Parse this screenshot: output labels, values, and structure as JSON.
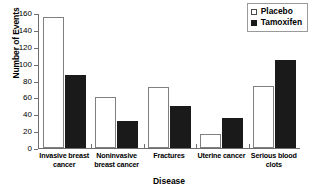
{
  "chart_data": {
    "type": "bar",
    "title": "",
    "subtitle": "",
    "xlabel": "Disease",
    "ylabel": "Number of Events",
    "ylim": [
      0,
      160
    ],
    "yticks": [
      0,
      20,
      40,
      60,
      80,
      100,
      120,
      140,
      160
    ],
    "grid": false,
    "legend_position": "top-right",
    "categories": [
      "Invasive breast cancer",
      "Noninvasive breast cancer",
      "Fractures",
      "Uterine cancer",
      "Serious blood clots"
    ],
    "category_lines": [
      [
        "Invasive breast",
        "cancer"
      ],
      [
        "Noninvasive",
        "breast cancer"
      ],
      [
        "Fractures"
      ],
      [
        "Uterine cancer"
      ],
      [
        "Serious blood",
        "clots"
      ]
    ],
    "series": [
      {
        "name": "Placebo",
        "color": "#ffffff",
        "edge_color": "#808080",
        "values": [
          155,
          60,
          72,
          17,
          73
        ]
      },
      {
        "name": "Tamoxifen",
        "color": "#1a1a1a",
        "edge_color": "#1a1a1a",
        "values": [
          86,
          32,
          50,
          35,
          104
        ]
      }
    ]
  },
  "legend": {
    "items": [
      {
        "label": "Placebo",
        "swatch": "open-square-swatch"
      },
      {
        "label": "Tamoxifen",
        "swatch": "filled-square-swatch"
      }
    ]
  },
  "axes": {
    "y_title": "Number of Events",
    "x_title": "Disease",
    "y_tick_labels": [
      "160",
      "140",
      "120",
      "100",
      "80",
      "60",
      "40",
      "20",
      "0"
    ]
  }
}
